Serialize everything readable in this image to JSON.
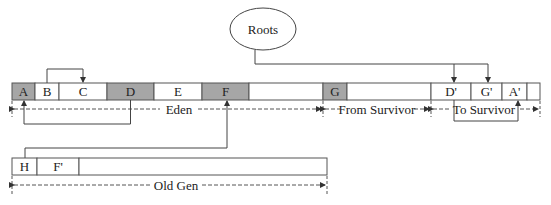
{
  "diagram": {
    "title": "",
    "roots": {
      "label": "Roots"
    },
    "colors": {
      "live_object_fill": "#a6a6a6",
      "empty_fill": "#ffffff",
      "stroke": "#555555",
      "text": "#222222"
    },
    "young_gen": {
      "cells": [
        {
          "label": "A",
          "shaded": true
        },
        {
          "label": "B",
          "shaded": false
        },
        {
          "label": "C",
          "shaded": false
        },
        {
          "label": "D",
          "shaded": true
        },
        {
          "label": "E",
          "shaded": false
        },
        {
          "label": "F",
          "shaded": true
        },
        {
          "label": "",
          "shaded": false
        },
        {
          "label": "G",
          "shaded": true
        },
        {
          "label": "",
          "shaded": false
        },
        {
          "label": "D'",
          "shaded": false
        },
        {
          "label": "G'",
          "shaded": false
        },
        {
          "label": "A'",
          "shaded": false
        },
        {
          "label": "",
          "shaded": false
        }
      ],
      "regions": [
        {
          "label": "Eden"
        },
        {
          "label": "From Survivor"
        },
        {
          "label": "To Survivor"
        }
      ]
    },
    "old_gen": {
      "cells": [
        {
          "label": "H"
        },
        {
          "label": "F'"
        },
        {
          "label": ""
        }
      ],
      "region_label": "Old Gen"
    },
    "references": [
      {
        "from": "B",
        "to": "C"
      },
      {
        "from": "D",
        "to": "A"
      },
      {
        "from": "H",
        "to": "F"
      },
      {
        "from": "Roots",
        "to": "D'"
      },
      {
        "from": "Roots",
        "to": "G'"
      },
      {
        "from": "D'",
        "to": "A'"
      }
    ]
  }
}
